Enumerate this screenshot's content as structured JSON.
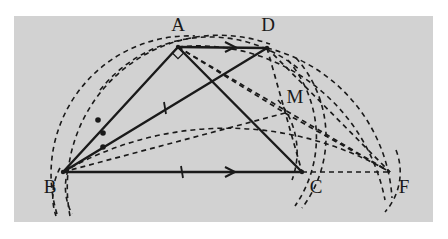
{
  "figure": {
    "background_color": "#ffffff",
    "panel_color": "#d2d2d2",
    "stroke_color": "#1a1a1a",
    "panel": {
      "x": 14,
      "y": 16,
      "width": 419,
      "height": 206
    }
  },
  "points": {
    "A": {
      "x": 178,
      "y": 47,
      "label": "A",
      "label_x": 178,
      "label_y": 27
    },
    "B": {
      "x": 63,
      "y": 172,
      "label": "B",
      "label_x": 50,
      "label_y": 189
    },
    "C": {
      "x": 302,
      "y": 172,
      "label": "C",
      "label_x": 316,
      "label_y": 189
    },
    "D": {
      "x": 267,
      "y": 48,
      "label": "D",
      "label_x": 268,
      "label_y": 27
    },
    "M": {
      "x": 285,
      "y": 113,
      "label": "M",
      "label_x": 295,
      "label_y": 99
    },
    "F": {
      "x": 390,
      "y": 172,
      "label": "F",
      "label_x": 404,
      "label_y": 189
    }
  },
  "solid_segments": [
    {
      "name": "segment-AD",
      "from": "A",
      "to": "D",
      "marker": "arrow"
    },
    {
      "name": "segment-BC",
      "from": "B",
      "to": "C",
      "marker": "arrow"
    },
    {
      "name": "segment-AB",
      "from": "A",
      "to": "B",
      "marker": "none"
    },
    {
      "name": "segment-BD",
      "from": "B",
      "to": "D",
      "marker": "tick"
    },
    {
      "name": "segment-AC",
      "from": "A",
      "to": "C",
      "marker": "none"
    }
  ],
  "dashed_segments": [
    {
      "name": "segment-BM",
      "from": "B",
      "to": "M"
    },
    {
      "name": "segment-DF",
      "from": "D",
      "to": "F"
    },
    {
      "name": "segment-CF",
      "from": "C",
      "to": "F"
    },
    {
      "name": "segment-AM",
      "from": "A",
      "to": "M"
    },
    {
      "name": "segment-DM-C",
      "from": "D",
      "to": "C"
    },
    {
      "name": "segment-MF",
      "from": "M",
      "to": "F"
    },
    {
      "name": "segment-AF",
      "from": "A",
      "to": "F"
    }
  ],
  "tick_marks": [
    {
      "name": "tick-BD",
      "x": 165,
      "y": 108
    },
    {
      "name": "tick-BC",
      "x": 182,
      "y": 172
    }
  ],
  "arrow_marks": [
    {
      "name": "arrow-AD",
      "x": 232,
      "y": 47
    },
    {
      "name": "arrow-BC",
      "x": 232,
      "y": 172
    }
  ],
  "angle_dots": [
    {
      "name": "angle-dot-1",
      "x": 98,
      "y": 120
    },
    {
      "name": "angle-dot-2",
      "x": 103,
      "y": 133
    },
    {
      "name": "angle-dot-3",
      "x": 103,
      "y": 147
    }
  ],
  "right_angle_marker": {
    "name": "right-angle-at-A",
    "x": 178,
    "y": 53
  },
  "arcs": [
    {
      "name": "arc-radius-BA-large",
      "d": "M 57 214 A 138 138 0 0 1 195 36"
    },
    {
      "name": "arc-radius-BD-full",
      "d": "M 70 216 A 152 152 0 0 1 270 44"
    },
    {
      "name": "arc-through-AD-top",
      "d": "M 100 90 A 140 140 0 0 1 300 70"
    },
    {
      "name": "arc-BF-outer",
      "d": "M 63 172 A 327 327 0 0 1 390 172"
    },
    {
      "name": "arc-D-to-F",
      "d": "M 267 48 A 165 165 0 0 1 392 198"
    },
    {
      "name": "arc-M-sweep",
      "d": "M 178 47 A 190 190 0 0 1 385 200"
    },
    {
      "name": "arc-C-down",
      "d": "M 288 60 A 120 120 0 0 1 295 206"
    },
    {
      "name": "arc-C-down-2",
      "d": "M 296 58 A 118 118 0 0 1 302 208"
    },
    {
      "name": "arc-F-down",
      "d": "M 396 150 A 60 60 0 0 1 385 212"
    },
    {
      "name": "arc-B-down-1",
      "d": "M 60 168 A 60 60 0 0 0 56 216"
    },
    {
      "name": "arc-B-down-2",
      "d": "M 68 170 A 58 58 0 0 0 72 214"
    },
    {
      "name": "arc-M-to-C",
      "d": "M 278 100 A 80 80 0 0 1 292 180"
    }
  ]
}
